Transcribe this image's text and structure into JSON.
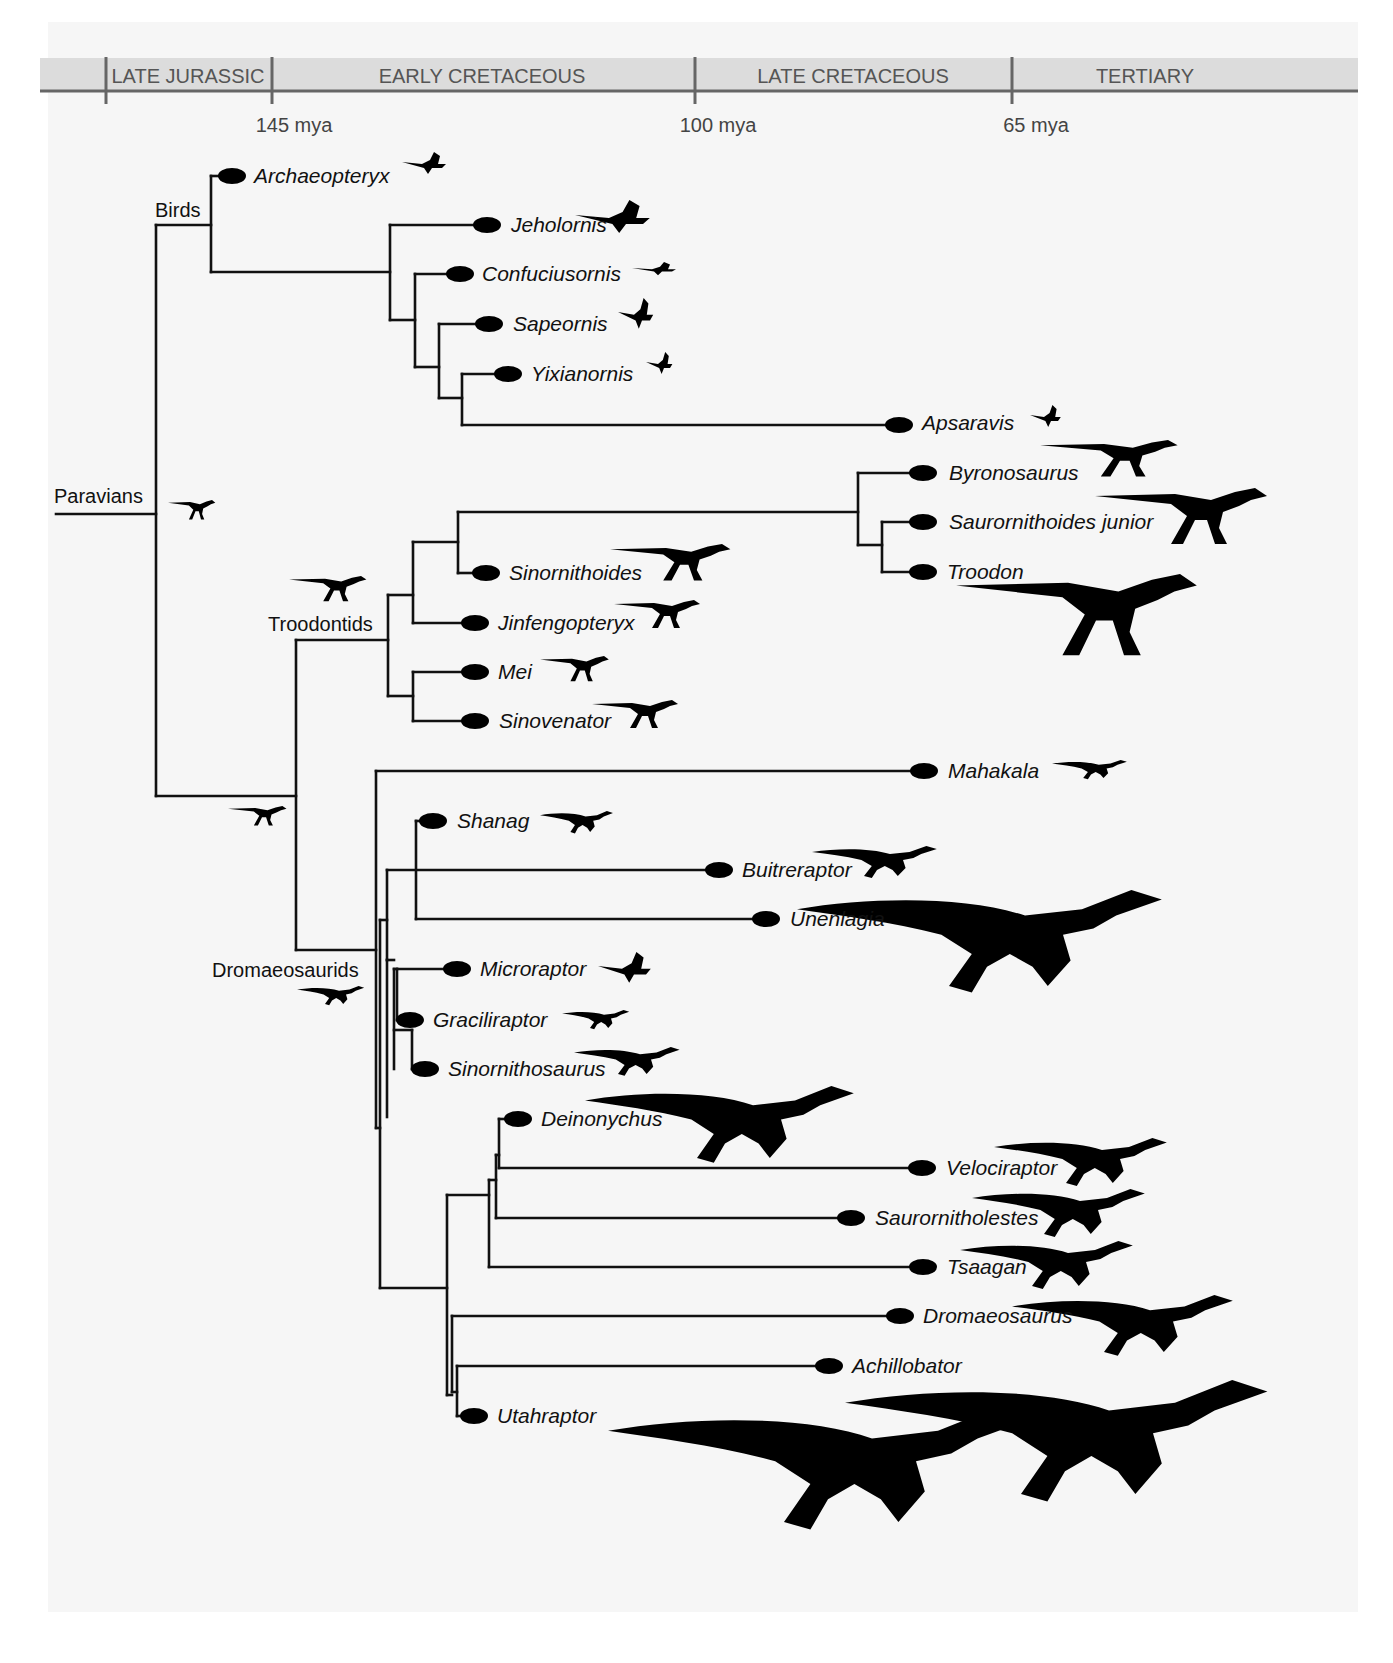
{
  "figure": {
    "type": "phylogenetic-tree"
  },
  "timescale": {
    "periods": [
      {
        "label": "LATE JURASSIC",
        "center_x": 188
      },
      {
        "label": "EARLY CRETACEOUS",
        "center_x": 482
      },
      {
        "label": "LATE CRETACEOUS",
        "center_x": 853
      },
      {
        "label": "TERTIARY",
        "center_x": 1145
      }
    ],
    "boundaries": [
      {
        "label": "145 mya",
        "x": 272
      },
      {
        "label": "100 mya",
        "x": 695
      },
      {
        "label": "65 mya",
        "x": 1012
      }
    ],
    "colors": {
      "band": "#dcdcdc",
      "axis": "#666666",
      "text": "#555555"
    }
  },
  "clades": [
    {
      "label": "Paravians",
      "x": 54,
      "y": 484
    },
    {
      "label": "Birds",
      "x": 155,
      "y": 198
    },
    {
      "label": "Troodontids",
      "x": 268,
      "y": 612
    },
    {
      "label": "Dromaeosaurids",
      "x": 212,
      "y": 958
    }
  ],
  "taxa": [
    {
      "name": "Archaeopteryx",
      "group": "Birds",
      "node_x": 232,
      "y": 176,
      "silhouette": "bird-icon"
    },
    {
      "name": "Jeholornis",
      "group": "Birds",
      "node_x": 487,
      "y": 225,
      "silhouette": "bird-icon"
    },
    {
      "name": "Confuciusornis",
      "group": "Birds",
      "node_x": 460,
      "y": 274,
      "silhouette": "bird-icon"
    },
    {
      "name": "Sapeornis",
      "group": "Birds",
      "node_x": 489,
      "y": 324,
      "silhouette": "bird-icon"
    },
    {
      "name": "Yixianornis",
      "group": "Birds",
      "node_x": 508,
      "y": 374,
      "silhouette": "bird-icon"
    },
    {
      "name": "Apsaravis",
      "group": "Birds",
      "node_x": 899,
      "y": 423,
      "silhouette": "bird-icon"
    },
    {
      "name": "Byronosaurus",
      "group": "Troodontids",
      "node_x": 923,
      "y": 473,
      "silhouette": "theropod-icon"
    },
    {
      "name": "Saurornithoides junior",
      "group": "Troodontids",
      "node_x": 923,
      "y": 522,
      "silhouette": "theropod-icon"
    },
    {
      "name": "Troodon",
      "group": "Troodontids",
      "node_x": 923,
      "y": 572,
      "silhouette": "theropod-icon"
    },
    {
      "name": "Sinornithoides",
      "group": "Troodontids",
      "node_x": 486,
      "y": 573,
      "silhouette": "theropod-icon"
    },
    {
      "name": "Jinfengopteryx",
      "group": "Troodontids",
      "node_x": 475,
      "y": 623,
      "silhouette": "theropod-icon"
    },
    {
      "name": "Mei",
      "group": "Troodontids",
      "node_x": 475,
      "y": 672,
      "silhouette": "theropod-icon"
    },
    {
      "name": "Sinovenator",
      "group": "Troodontids",
      "node_x": 475,
      "y": 721,
      "silhouette": "theropod-icon"
    },
    {
      "name": "Mahakala",
      "group": "Dromaeosaurids",
      "node_x": 924,
      "y": 771,
      "silhouette": "raptor-icon"
    },
    {
      "name": "Shanag",
      "group": "Dromaeosaurids",
      "node_x": 433,
      "y": 821,
      "silhouette": "raptor-icon"
    },
    {
      "name": "Buitreraptor",
      "group": "Dromaeosaurids",
      "node_x": 719,
      "y": 870,
      "silhouette": "raptor-icon"
    },
    {
      "name": "Unenlagia",
      "group": "Dromaeosaurids",
      "node_x": 766,
      "y": 919,
      "silhouette": "raptor-icon"
    },
    {
      "name": "Microraptor",
      "group": "Dromaeosaurids",
      "node_x": 457,
      "y": 969,
      "silhouette": "winged-raptor-icon"
    },
    {
      "name": "Graciliraptor",
      "group": "Dromaeosaurids",
      "node_x": 410,
      "y": 1020,
      "silhouette": "raptor-icon"
    },
    {
      "name": "Sinornithosaurus",
      "group": "Dromaeosaurids",
      "node_x": 425,
      "y": 1069,
      "silhouette": "raptor-icon"
    },
    {
      "name": "Deinonychus",
      "group": "Dromaeosaurids",
      "node_x": 518,
      "y": 1119,
      "silhouette": "raptor-icon"
    },
    {
      "name": "Velociraptor",
      "group": "Dromaeosaurids",
      "node_x": 922,
      "y": 1168,
      "silhouette": "raptor-icon"
    },
    {
      "name": "Saurornitholestes",
      "group": "Dromaeosaurids",
      "node_x": 851,
      "y": 1218,
      "silhouette": "raptor-icon"
    },
    {
      "name": "Tsaagan",
      "group": "Dromaeosaurids",
      "node_x": 923,
      "y": 1267,
      "silhouette": "raptor-icon"
    },
    {
      "name": "Dromaeosaurus",
      "group": "Dromaeosaurids",
      "node_x": 900,
      "y": 1316,
      "silhouette": "raptor-icon"
    },
    {
      "name": "Achillobator",
      "group": "Dromaeosaurids",
      "node_x": 829,
      "y": 1366,
      "silhouette": "raptor-icon"
    },
    {
      "name": "Utahraptor",
      "group": "Dromaeosaurids",
      "node_x": 474,
      "y": 1416,
      "silhouette": "raptor-icon"
    }
  ],
  "colors": {
    "branch": "#111111",
    "node": "#000000",
    "background": "#f6f6f6"
  }
}
